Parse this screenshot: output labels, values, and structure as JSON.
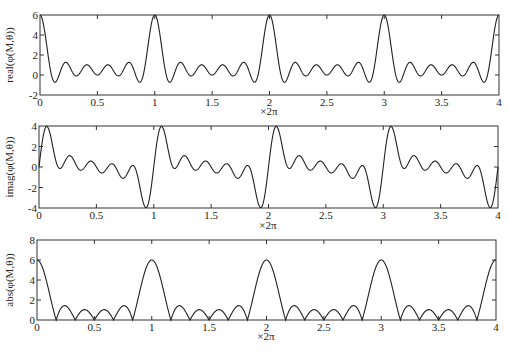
{
  "chart_data": [
    {
      "type": "line",
      "title": "",
      "xlabel": "×2π",
      "ylabel": "real(φ(M,θ))",
      "xlim": [
        0,
        4
      ],
      "ylim": [
        -2,
        6
      ],
      "xticks": [
        "0",
        "0.5",
        "1",
        "1.5",
        "2",
        "2.5",
        "3",
        "3.5",
        "4"
      ],
      "yticks": [
        "-2",
        "0",
        "2",
        "4",
        "6"
      ],
      "grid": false,
      "legend": null,
      "function": "real(sum_{k=0}^{5} e^{j k θ}), θ = 2π·x",
      "series": [
        {
          "name": "real",
          "x": [
            0,
            0.0833,
            0.1667,
            0.25,
            0.3333,
            0.4167,
            0.5,
            0.5833,
            0.6667,
            0.75,
            0.8333,
            0.9167,
            1,
            2,
            3,
            4
          ],
          "values": [
            6,
            1.87,
            0,
            1,
            0,
            0.13,
            0,
            0.13,
            0,
            1,
            0,
            1.87,
            6,
            6,
            6,
            6
          ]
        }
      ]
    },
    {
      "type": "line",
      "title": "",
      "xlabel": "×2π",
      "ylabel": "imag(φ(M,θ))",
      "xlim": [
        0,
        4
      ],
      "ylim": [
        -4,
        4
      ],
      "xticks": [
        "0",
        "0.5",
        "1",
        "1.5",
        "2",
        "2.5",
        "3",
        "3.5",
        "4"
      ],
      "yticks": [
        "-4",
        "-2",
        "0",
        "2",
        "4"
      ],
      "grid": false,
      "legend": null,
      "function": "imag(sum_{k=0}^{5} e^{j k θ}), θ = 2π·x",
      "series": [
        {
          "name": "imag",
          "x": [
            0,
            0.07,
            0.1667,
            0.25,
            0.3333,
            0.5,
            0.6667,
            0.75,
            0.8333,
            0.93,
            1
          ],
          "values": [
            0,
            3.9,
            0,
            1,
            0,
            0,
            0,
            -1,
            0,
            -3.9,
            0
          ]
        }
      ]
    },
    {
      "type": "line",
      "title": "",
      "xlabel": "×2π",
      "ylabel": "abs(φ(M,θ))",
      "xlim": [
        0,
        4
      ],
      "ylim": [
        0,
        8
      ],
      "xticks": [
        "0",
        "0.5",
        "1",
        "1.5",
        "2",
        "2.5",
        "3",
        "3.5",
        "4"
      ],
      "yticks": [
        "0",
        "2",
        "4",
        "6",
        "8"
      ],
      "grid": false,
      "legend": null,
      "function": "abs(sum_{k=0}^{5} e^{j k θ}), θ = 2π·x",
      "series": [
        {
          "name": "abs",
          "x": [
            0,
            0.1667,
            0.25,
            0.3333,
            0.4167,
            0.5,
            0.5833,
            0.6667,
            0.75,
            0.8333,
            1
          ],
          "values": [
            6,
            0,
            1.41,
            0,
            1.04,
            0,
            1.04,
            0,
            1.41,
            0,
            6
          ]
        }
      ]
    }
  ],
  "params": {
    "M": 6,
    "x_min": 0,
    "x_max": 4,
    "samples": 1200
  },
  "panels": [
    {
      "ylabel": "real(φ(M,θ))",
      "xunit": "×2π",
      "yticks": [
        "-2",
        "0",
        "2",
        "4",
        "6"
      ],
      "ymin": -2,
      "ymax": 6,
      "kind": "real"
    },
    {
      "ylabel": "imag(φ(M,θ))",
      "xunit": "×2π",
      "yticks": [
        "-4",
        "-2",
        "0",
        "2",
        "4"
      ],
      "ymin": -4,
      "ymax": 4,
      "kind": "imag"
    },
    {
      "ylabel": "abs(φ(M,θ))",
      "xunit": "×2π",
      "yticks": [
        "0",
        "2",
        "4",
        "6",
        "8"
      ],
      "ymin": 0,
      "ymax": 8,
      "kind": "abs"
    }
  ],
  "xticks": [
    "0",
    "0.5",
    "1",
    "1.5",
    "2",
    "2.5",
    "3",
    "3.5",
    "4"
  ]
}
